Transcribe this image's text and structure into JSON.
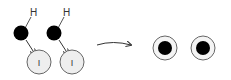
{
  "diagram": {
    "reactants": [
      {
        "h_label": "H",
        "i_label": "I"
      },
      {
        "h_label": "H",
        "i_label": "I"
      }
    ],
    "products": [
      {
        "label": ""
      },
      {
        "label": ""
      }
    ],
    "colors": {
      "electron": "#000000",
      "atom_fill": "#eeeeee",
      "stroke": "#555555"
    }
  }
}
